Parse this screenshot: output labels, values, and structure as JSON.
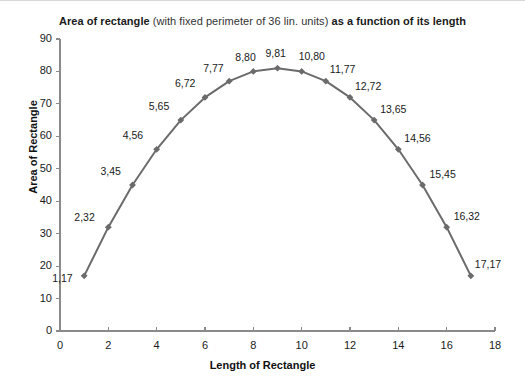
{
  "chart_data": {
    "type": "line",
    "title_parts": [
      {
        "text": "Area of rectangle ",
        "bold": true
      },
      {
        "text": "(with fixed perimeter of 36 lin. units) ",
        "bold": false
      },
      {
        "text": "as a function of its length",
        "bold": true
      }
    ],
    "title": "Area of rectangle (with fixed perimeter of 36 lin. units) as a function of its length",
    "xlabel": "Length of Rectangle",
    "ylabel": "Area of Rectangle",
    "xlim": [
      0,
      18
    ],
    "ylim": [
      0,
      90
    ],
    "x_ticks": [
      0,
      2,
      4,
      6,
      8,
      10,
      12,
      14,
      16,
      18
    ],
    "y_ticks": [
      0,
      10,
      20,
      30,
      40,
      50,
      60,
      70,
      80,
      90
    ],
    "grid": false,
    "legend": "none",
    "series_color": "#6b6b6b",
    "marker": "diamond",
    "x": [
      1,
      2,
      3,
      4,
      5,
      6,
      7,
      8,
      9,
      10,
      11,
      12,
      13,
      14,
      15,
      16,
      17
    ],
    "values": [
      17,
      32,
      45,
      56,
      65,
      72,
      77,
      80,
      81,
      80,
      77,
      72,
      65,
      56,
      45,
      32,
      17
    ],
    "point_labels": [
      {
        "text": "1,17",
        "x": 1,
        "y": 17,
        "dx": -32,
        "dy": -4
      },
      {
        "text": "2,32",
        "x": 2,
        "y": 32,
        "dx": -34,
        "dy": -16
      },
      {
        "text": "3,45",
        "x": 3,
        "y": 45,
        "dx": -32,
        "dy": -20
      },
      {
        "text": "4,56",
        "x": 4,
        "y": 56,
        "dx": -34,
        "dy": -20
      },
      {
        "text": "5,65",
        "x": 5,
        "y": 65,
        "dx": -32,
        "dy": -20
      },
      {
        "text": "6,72",
        "x": 6,
        "y": 72,
        "dx": -30,
        "dy": -20
      },
      {
        "text": "7,77",
        "x": 7,
        "y": 77,
        "dx": -26,
        "dy": -19
      },
      {
        "text": "8,80",
        "x": 8,
        "y": 80,
        "dx": -18,
        "dy": -20
      },
      {
        "text": "9,81",
        "x": 9,
        "y": 81,
        "dx": -12,
        "dy": -21
      },
      {
        "text": "10,80",
        "x": 10,
        "y": 80,
        "dx": -3,
        "dy": -21
      },
      {
        "text": "11,77",
        "x": 11,
        "y": 77,
        "dx": 4,
        "dy": -18
      },
      {
        "text": "12,72",
        "x": 12,
        "y": 72,
        "dx": 5,
        "dy": -17
      },
      {
        "text": "13,65",
        "x": 13,
        "y": 65,
        "dx": 6,
        "dy": -17
      },
      {
        "text": "14,56",
        "x": 14,
        "y": 56,
        "dx": 6,
        "dy": -17
      },
      {
        "text": "15,45",
        "x": 15,
        "y": 45,
        "dx": 7,
        "dy": -17
      },
      {
        "text": "16,32",
        "x": 16,
        "y": 32,
        "dx": 7,
        "dy": -17
      },
      {
        "text": "17,17",
        "x": 17,
        "y": 17,
        "dx": 4,
        "dy": -18
      }
    ]
  }
}
